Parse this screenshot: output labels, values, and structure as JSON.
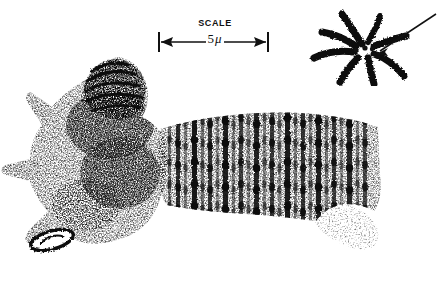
{
  "figure": {
    "type": "scientific-illustration",
    "background_color": "#ffffff",
    "ink_color": "#111111",
    "width": 442,
    "height": 283
  },
  "scale_bar": {
    "caption": "SCALE",
    "value_number": "5",
    "value_unit": "μ",
    "value_full": "5μ",
    "left_tick_x": 159,
    "right_tick_x": 268,
    "bar_y": 45,
    "arrowheads": "both-ends"
  },
  "inset": {
    "name": "chromosome-complement-inset",
    "description": "radiating chromosome arms with central chromocenter dots",
    "arm_count": 7,
    "center_dot_count": 3,
    "arrow": {
      "present": true,
      "direction": "down-left",
      "points_to": "chromocenter"
    }
  },
  "specimen": {
    "name": "polytene-chromosome",
    "regions": [
      {
        "name": "head-cap",
        "label": "dark terminal cap",
        "texture": "dense-dark"
      },
      {
        "name": "stippled-body",
        "label": "granular proximal region",
        "texture": "stipple"
      },
      {
        "name": "banded-arm",
        "label": "banded chromosome arm",
        "texture": "transverse-bands"
      },
      {
        "name": "distal-tail",
        "label": "tapering distal tip",
        "texture": "light-stipple"
      },
      {
        "name": "nucleolus",
        "label": "outlined oval body",
        "texture": "outline"
      }
    ],
    "band_count": 26,
    "orientation": "head-left, tail-right"
  },
  "chart_data": {
    "type": "scatter",
    "title": "",
    "xlabel": "",
    "ylabel": "",
    "grid": false,
    "legend": null,
    "annotations": [
      "SCALE",
      "5μ"
    ],
    "scale_bar_microns": 5,
    "scale_bar_pixels": 109,
    "bands": [
      {
        "x": 168,
        "width": 3,
        "weight": 0.55
      },
      {
        "x": 176,
        "width": 4,
        "weight": 0.85
      },
      {
        "x": 184,
        "width": 3,
        "weight": 0.45
      },
      {
        "x": 192,
        "width": 5,
        "weight": 0.95
      },
      {
        "x": 201,
        "width": 3,
        "weight": 0.5
      },
      {
        "x": 208,
        "width": 4,
        "weight": 0.8
      },
      {
        "x": 216,
        "width": 3,
        "weight": 0.4
      },
      {
        "x": 223,
        "width": 5,
        "weight": 0.9
      },
      {
        "x": 232,
        "width": 3,
        "weight": 0.45
      },
      {
        "x": 239,
        "width": 4,
        "weight": 0.75
      },
      {
        "x": 247,
        "width": 3,
        "weight": 0.38
      },
      {
        "x": 254,
        "width": 5,
        "weight": 0.88
      },
      {
        "x": 263,
        "width": 3,
        "weight": 0.42
      },
      {
        "x": 270,
        "width": 4,
        "weight": 0.78
      },
      {
        "x": 278,
        "width": 3,
        "weight": 0.4
      },
      {
        "x": 285,
        "width": 5,
        "weight": 0.92
      },
      {
        "x": 294,
        "width": 3,
        "weight": 0.48
      },
      {
        "x": 301,
        "width": 4,
        "weight": 0.8
      },
      {
        "x": 309,
        "width": 3,
        "weight": 0.42
      },
      {
        "x": 316,
        "width": 5,
        "weight": 0.9
      },
      {
        "x": 325,
        "width": 3,
        "weight": 0.45
      },
      {
        "x": 332,
        "width": 4,
        "weight": 0.76
      },
      {
        "x": 340,
        "width": 3,
        "weight": 0.38
      },
      {
        "x": 347,
        "width": 5,
        "weight": 0.86
      },
      {
        "x": 356,
        "width": 3,
        "weight": 0.44
      },
      {
        "x": 363,
        "width": 4,
        "weight": 0.7
      }
    ]
  }
}
